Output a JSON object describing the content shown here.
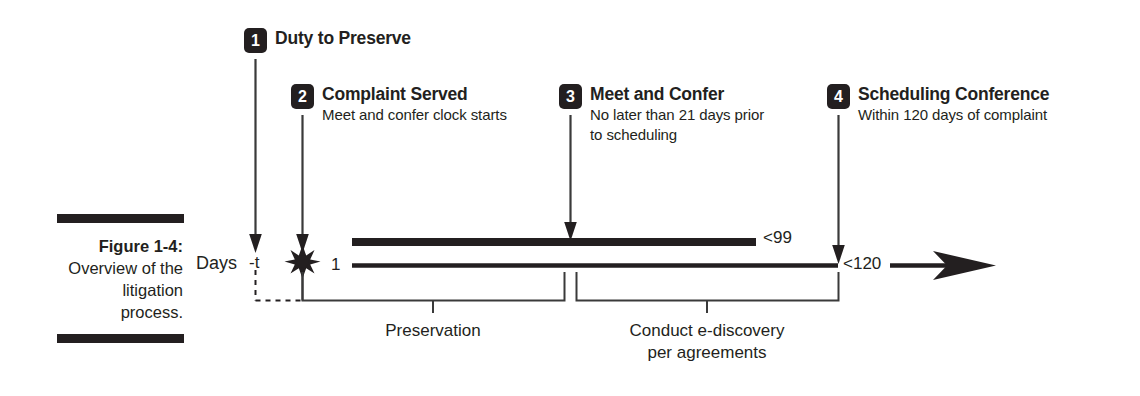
{
  "figure": {
    "caption_title": "Figure 1-4:",
    "caption_desc": "Overview of the litigation process.",
    "rule_color": "#231f20"
  },
  "milestones": [
    {
      "number": "1",
      "title": "Duty to Preserve",
      "subtitle": ""
    },
    {
      "number": "2",
      "title": "Complaint Served",
      "subtitle": "Meet and confer clock starts"
    },
    {
      "number": "3",
      "title": "Meet and Confer",
      "subtitle_line1": "No later than 21 days prior",
      "subtitle_line2": "to scheduling"
    },
    {
      "number": "4",
      "title": "Scheduling Conference",
      "subtitle": "Within 120 days of complaint"
    }
  ],
  "axis": {
    "days_label": "Days",
    "tick_minus_t": "-t",
    "tick_one": "1",
    "tick_99": "<99",
    "tick_120": "<120"
  },
  "phases": [
    {
      "label": "Preservation"
    },
    {
      "label_line1": "Conduct e-discovery",
      "label_line2": "per agreements"
    }
  ],
  "colors": {
    "ink": "#231f20",
    "line": "#3a3a3a",
    "background": "#ffffff"
  }
}
